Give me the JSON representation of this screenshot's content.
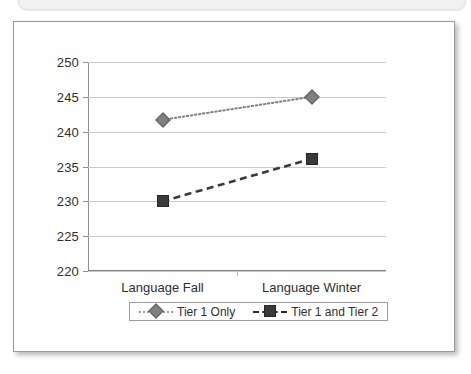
{
  "chart_data": {
    "type": "line",
    "title": "",
    "xlabel": "",
    "ylabel": "",
    "categories": [
      "Language Fall",
      "Language Winter"
    ],
    "ylim": [
      220,
      250
    ],
    "yticks": [
      220,
      225,
      230,
      235,
      240,
      245,
      250
    ],
    "grid": true,
    "legend_position": "bottom",
    "series": [
      {
        "name": "Tier 1 Only",
        "values": [
          241.7,
          245.0
        ],
        "line_style": "dotted",
        "marker": "diamond",
        "color": "#808080"
      },
      {
        "name": "Tier 1 and Tier 2",
        "values": [
          230.0,
          236.1
        ],
        "line_style": "dashed",
        "marker": "square",
        "color": "#3a3a3a"
      }
    ]
  },
  "legend": {
    "entries": [
      {
        "label": "Tier 1 Only"
      },
      {
        "label": "Tier 1 and Tier 2"
      }
    ]
  },
  "axis": {
    "y_tick_labels": [
      "250",
      "245",
      "240",
      "235",
      "230",
      "225",
      "220"
    ],
    "x_tick_labels": [
      "Language Fall",
      "Language Winter"
    ]
  },
  "colors": {
    "series_tier1": "#808080",
    "series_tier12": "#3a3a3a",
    "gridline": "#c9c9c9",
    "axis": "#7d7d7d",
    "frame_border": "#9a9a9a",
    "text": "#2f2f2f"
  }
}
